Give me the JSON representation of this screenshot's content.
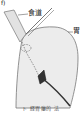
{
  "figure": {
    "panel_label": "f)",
    "labels": {
      "esophagus": "食道",
      "stomach": "胃"
    },
    "caption": "ト 経胃瘻的 法"
  }
}
